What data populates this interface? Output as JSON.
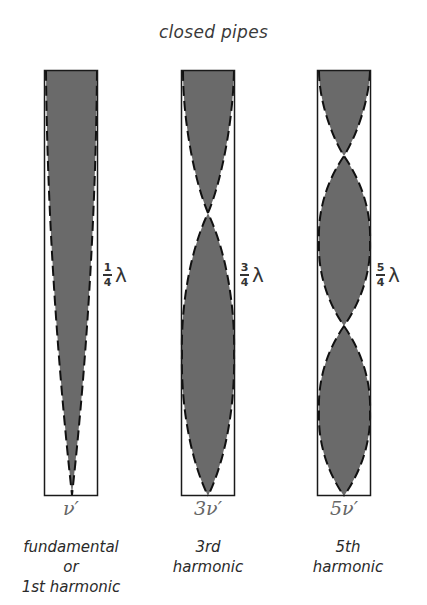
{
  "title": "closed pipes",
  "colors": {
    "fill": "#6a6a6a",
    "outline": "#1a1a1a",
    "dash": "#111111",
    "freq_text": "#666666"
  },
  "pipes": [
    {
      "id": "fundamental",
      "length_fraction": {
        "numerator": "1",
        "denominator": "4"
      },
      "length_symbol": "λ",
      "frequency": "ν′",
      "caption_lines": [
        "fundamental",
        "or",
        "1st harmonic"
      ],
      "antinodes_at_top": 1,
      "loops": 1
    },
    {
      "id": "third",
      "length_fraction": {
        "numerator": "3",
        "denominator": "4"
      },
      "length_symbol": "λ",
      "frequency": "3ν′",
      "caption_lines": [
        "3rd",
        "harmonic"
      ],
      "loops": 3
    },
    {
      "id": "fifth",
      "length_fraction": {
        "numerator": "5",
        "denominator": "4"
      },
      "length_symbol": "λ",
      "frequency": "5ν′",
      "caption_lines": [
        "5th",
        "harmonic"
      ],
      "loops": 5
    }
  ]
}
